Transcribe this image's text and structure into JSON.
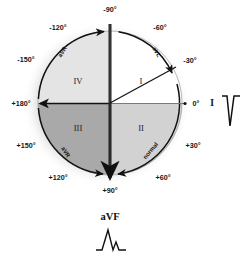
{
  "diagram": {
    "center": {
      "x": 110,
      "y": 103
    },
    "radius": 72,
    "colors": {
      "halo": "#dcdcdc",
      "quadrant_I": "#ffffff",
      "quadrant_II": "#d2d2d2",
      "quadrant_III": "#a9a9a9",
      "quadrant_IV": "#e2e2e2",
      "stroke": "#111111",
      "text": "#151515"
    },
    "angle_labels": [
      {
        "text": "-90°",
        "x": 110,
        "y": 12,
        "anchor": "middle"
      },
      {
        "text": "-60°",
        "x": 160,
        "y": 30,
        "anchor": "middle"
      },
      {
        "text": "-30°",
        "x": 190,
        "y": 63,
        "anchor": "middle"
      },
      {
        "text": "0°",
        "x": 196,
        "y": 105,
        "anchor": "middle"
      },
      {
        "text": "+30°",
        "x": 192,
        "y": 148,
        "anchor": "middle"
      },
      {
        "text": "+60°",
        "x": 163,
        "y": 180,
        "anchor": "middle"
      },
      {
        "text": "+90°",
        "x": 110,
        "y": 193,
        "anchor": "middle"
      },
      {
        "text": "+120°",
        "x": 57,
        "y": 180,
        "anchor": "middle"
      },
      {
        "text": "+150°",
        "x": 26,
        "y": 148,
        "anchor": "middle"
      },
      {
        "text": "+180°",
        "x": 21,
        "y": 105,
        "anchor": "middle"
      },
      {
        "text": "-150°",
        "x": 26,
        "y": 62,
        "anchor": "middle"
      },
      {
        "text": "-120°",
        "x": 58,
        "y": 30,
        "anchor": "middle"
      }
    ],
    "quadrant_labels": [
      {
        "text": "I",
        "x": 141,
        "y": 81,
        "name": "quadrant-label-i"
      },
      {
        "text": "II",
        "x": 141,
        "y": 128,
        "name": "quadrant-label-ii"
      },
      {
        "text": "III",
        "x": 78,
        "y": 128,
        "name": "quadrant-label-iii"
      },
      {
        "text": "IV",
        "x": 78,
        "y": 81,
        "name": "quadrant-label-iv"
      }
    ],
    "curved_lead_labels": [
      {
        "text": "aVL",
        "x": 155,
        "y": 53,
        "rotate": 58,
        "name": "curved-lead-label-avl"
      },
      {
        "text": "aVR",
        "x": 64,
        "y": 53,
        "rotate": -58,
        "name": "curved-lead-label-avr"
      },
      {
        "text": "aVR",
        "x": 64,
        "y": 153,
        "rotate": 58,
        "name": "curved-lead-label-avr-lower"
      },
      {
        "text": "normal",
        "x": 152,
        "y": 152,
        "rotate": -50,
        "name": "curved-lead-label-normal"
      }
    ],
    "axis_lines": {
      "vertical_label_top": "-90°",
      "vertical_label_bottom": "+90°",
      "horizontal_label_right": "0°",
      "horizontal_label_left": "+180°",
      "radius_line_angle": "-30°"
    }
  },
  "traces": {
    "lead_I": {
      "label": "I",
      "label_x": 213,
      "label_y": 106,
      "morphology": "predominantly negative QRS",
      "name": "lead-i-ecg-trace"
    },
    "lead_aVF": {
      "label": "aVF",
      "label_x": 110,
      "label_y": 216,
      "morphology": "tall positive QRS",
      "name": "lead-avf-ecg-trace"
    }
  }
}
